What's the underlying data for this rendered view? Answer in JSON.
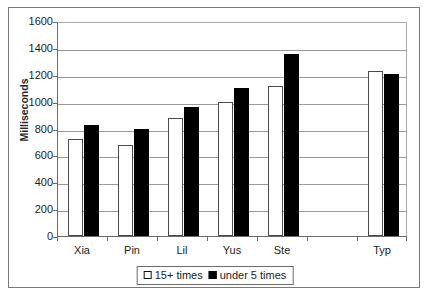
{
  "chart_data": {
    "type": "bar",
    "title": "",
    "xlabel": "",
    "ylabel": "Milliseconds",
    "ylim": [
      0,
      1600
    ],
    "ytick_step": 200,
    "yticks": [
      1600,
      1400,
      1200,
      1000,
      800,
      600,
      400,
      200,
      0
    ],
    "grid": true,
    "legend_position": "bottom-center",
    "categories": [
      "Xia",
      "Pin",
      "Lil",
      "Yus",
      "Ste",
      "",
      "Typ"
    ],
    "series": [
      {
        "name": "15+ times",
        "color": "#ffffff",
        "edge_color": "#000000",
        "values": [
          720,
          675,
          875,
          1000,
          1115,
          null,
          1225
        ]
      },
      {
        "name": "under 5 times",
        "color": "#000000",
        "edge_color": "#000000",
        "values": [
          825,
          800,
          960,
          1105,
          1355,
          null,
          1205
        ]
      }
    ]
  },
  "axis": {
    "y_label": "Milliseconds",
    "y_tick_labels": [
      "1600",
      "1400",
      "1200",
      "1000",
      "800",
      "600",
      "400",
      "200",
      "0"
    ],
    "x_tick_labels": [
      "Xia",
      "Pin",
      "Lil",
      "Yus",
      "Ste",
      "",
      "Typ"
    ]
  },
  "legend": {
    "items": [
      {
        "label": "15+ times",
        "swatch": "white-square-icon"
      },
      {
        "label": "under 5 times",
        "swatch": "black-square-icon"
      }
    ]
  }
}
